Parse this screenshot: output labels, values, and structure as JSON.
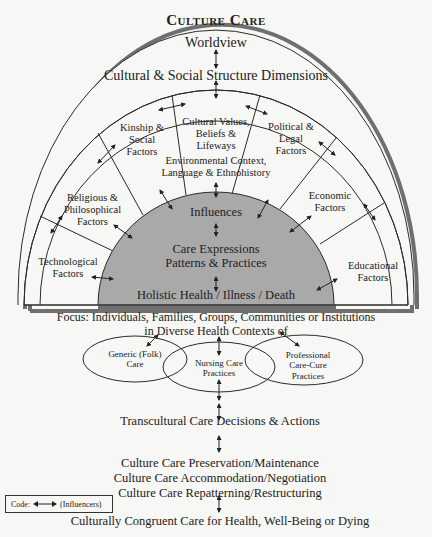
{
  "title": "Culture Care",
  "outer": {
    "worldview": "Worldview",
    "dimensions": "Cultural & Social Structure Dimensions"
  },
  "factors": [
    {
      "id": "technological",
      "lines": [
        "Technological",
        "Factors"
      ]
    },
    {
      "id": "religious",
      "lines": [
        "Religious &",
        "Philosophical",
        "Factors"
      ]
    },
    {
      "id": "kinship",
      "lines": [
        "Kinship &",
        "Social",
        "Factors"
      ]
    },
    {
      "id": "cultural-values",
      "lines": [
        "Cultural Values,",
        "Beliefs &",
        "Lifeways"
      ]
    },
    {
      "id": "political",
      "lines": [
        "Political &",
        "Legal",
        "Factors"
      ]
    },
    {
      "id": "economic",
      "lines": [
        "Economic",
        "Factors"
      ]
    },
    {
      "id": "educational",
      "lines": [
        "Educational",
        "Factors"
      ]
    }
  ],
  "environment": {
    "line1": "Environmental Context,",
    "line2": "Language & Ethnohistory"
  },
  "core": {
    "influences": "Influences",
    "care_expressions_1": "Care Expressions",
    "care_expressions_2": "Patterns & Practices",
    "holistic": "Holistic Health / Illness / Death"
  },
  "focus": {
    "line1": "Focus: Individuals, Families, Groups, Communities or Institutions",
    "line2": "in Diverse Health Contexts of"
  },
  "care_systems": [
    {
      "id": "generic",
      "lines": [
        "Generic (Folk)",
        "Care"
      ]
    },
    {
      "id": "nursing",
      "lines": [
        "Nursing Care",
        "Practices"
      ]
    },
    {
      "id": "professional",
      "lines": [
        "Professional",
        "Care-Cure",
        "Practices"
      ]
    }
  ],
  "decisions": "Transcultural Care Decisions & Actions",
  "modes": [
    "Culture Care Preservation/Maintenance",
    "Culture Care Accommodation/Negotiation",
    "Culture Care Repatterning/Restructuring"
  ],
  "outcome": "Culturally Congruent Care for Health, Well-Being or Dying",
  "legend": {
    "code_label": "Code:",
    "meaning": "(Influencers)"
  },
  "colors": {
    "line": "#2a2a2a",
    "core_fill": "#a9a9a9",
    "shadow": "#6f6f6f",
    "background": "#f7f7f5"
  }
}
